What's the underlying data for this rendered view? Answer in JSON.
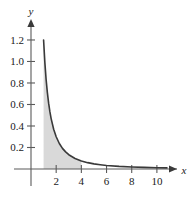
{
  "chart_data": {
    "type": "line",
    "title": "",
    "xlabel": "x",
    "ylabel": "y",
    "xlim": [
      0,
      11.2
    ],
    "ylim": [
      0,
      1.33
    ],
    "grid": false,
    "legend": null,
    "x_ticks": [
      2,
      4,
      6,
      8,
      10
    ],
    "x_tick_labels": [
      "2",
      "4",
      "6",
      "8",
      "10"
    ],
    "y_ticks": [
      0.2,
      0.4,
      0.6,
      0.8,
      1.0,
      1.2
    ],
    "y_tick_labels": [
      "0.2",
      "0.4",
      "0.6",
      "0.8",
      "1.0",
      "1.2"
    ],
    "series": [
      {
        "name": "curve",
        "x": [
          1.0,
          1.1,
          1.2,
          1.3,
          1.4,
          1.5,
          1.6,
          1.8,
          2.0,
          2.25,
          2.5,
          2.75,
          3.0,
          3.5,
          4.0,
          4.5,
          5.0,
          5.5,
          6.0,
          7.0,
          8.0,
          9.0,
          10.0,
          10.8
        ],
        "y": [
          1.2,
          0.992,
          0.833,
          0.71,
          0.612,
          0.533,
          0.469,
          0.37,
          0.3,
          0.237,
          0.192,
          0.159,
          0.133,
          0.098,
          0.075,
          0.059,
          0.048,
          0.04,
          0.033,
          0.024,
          0.019,
          0.015,
          0.012,
          0.01
        ]
      }
    ],
    "shaded_region": {
      "label": "area under curve",
      "x_start": 1.0,
      "x_end": 4.0,
      "color": "#d9d9d9"
    },
    "axis_arrows": {
      "x": "right",
      "y": "up"
    },
    "colors": {
      "curve": "#3a3a3a",
      "axis": "#5a5a5a",
      "fill": "#d9d9d9",
      "text": "#1a1a1a",
      "background": "#ffffff"
    }
  }
}
